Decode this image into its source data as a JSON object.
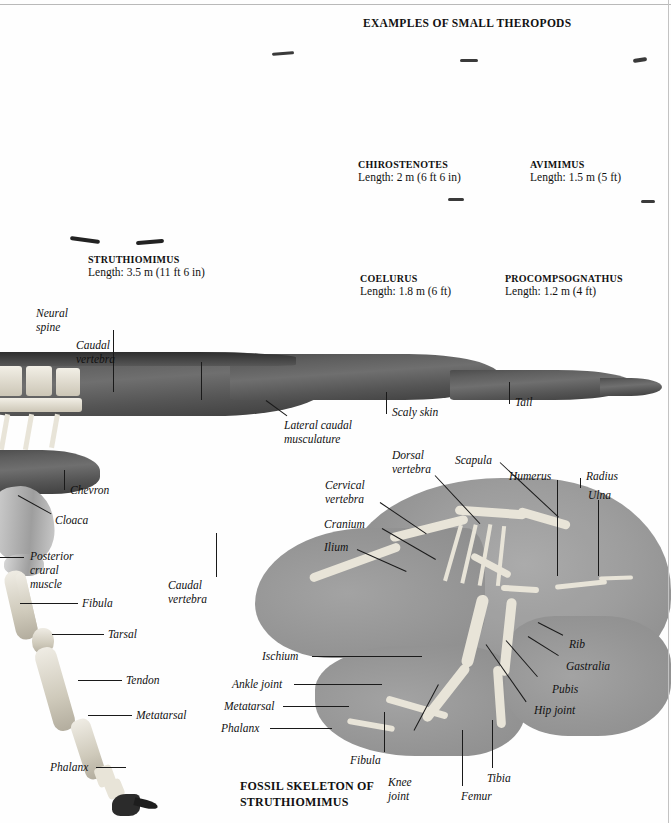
{
  "page": {
    "section_title": "EXAMPLES OF SMALL THEROPODS",
    "bottom_caption_line1": "FOSSIL SKELETON OF",
    "bottom_caption_line2": "STRUTHIOMIMUS",
    "ink_color": "#111111",
    "paper_color": "#fefefe"
  },
  "specimens": [
    {
      "name": "STRUTHIOMIMUS",
      "length": "Length: 3.5 m (11 ft 6 in)"
    },
    {
      "name": "CHIROSTENOTES",
      "length": "Length: 2 m (6 ft 6 in)"
    },
    {
      "name": "AVIMIMUS",
      "length": "Length: 1.5 m (5 ft)"
    },
    {
      "name": "COELURUS",
      "length": "Length: 1.8 m (6 ft)"
    },
    {
      "name": "PROCOMPSOGNATHUS",
      "length": "Length: 1.2 m (4 ft)"
    }
  ],
  "tail_labels": {
    "neural_spine": "Neural\nspine",
    "neural_spine_l1": "Neural",
    "neural_spine_l2": "spine",
    "caudal_vertebra_l1": "Caudal",
    "caudal_vertebra_l2": "vertebra",
    "lateral_caudal_l1": "Lateral caudal",
    "lateral_caudal_l2": "musculature",
    "scaly_skin": "Scaly skin",
    "tail": "Tail"
  },
  "body_labels": {
    "chevron": "Chevron",
    "cloaca": "Cloaca",
    "posterior_crural_l1": "Posterior",
    "posterior_crural_l2": "crural",
    "posterior_crural_l3": "muscle",
    "fibula": "Fibula",
    "tarsal": "Tarsal",
    "tendon": "Tendon",
    "metatarsal": "Metatarsal",
    "phalanx": "Phalanx"
  },
  "skeleton_labels": {
    "caudal_vertebra_l1": "Caudal",
    "caudal_vertebra_l2": "vertebra",
    "dorsal_vertebra_l1": "Dorsal",
    "dorsal_vertebra_l2": "vertebra",
    "cervical_vertebra_l1": "Cervical",
    "cervical_vertebra_l2": "vertebra",
    "cranium": "Cranium",
    "ilium": "Ilium",
    "scapula": "Scapula",
    "humerus": "Humerus",
    "radius": "Radius",
    "ulna": "Ulna",
    "rib": "Rib",
    "gastralia": "Gastralia",
    "pubis": "Pubis",
    "hip_joint": "Hip joint",
    "ischium": "Ischium",
    "ankle_joint": "Ankle joint",
    "metatarsal": "Metatarsal",
    "phalanx": "Phalanx",
    "fibula": "Fibula",
    "knee_joint_l1": "Knee",
    "knee_joint_l2": "joint",
    "femur": "Femur",
    "tibia": "Tibia"
  }
}
